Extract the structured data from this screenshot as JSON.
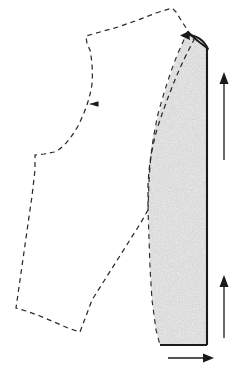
{
  "figure": {
    "width": 239,
    "height": 370,
    "background_color": "#ffffff"
  },
  "colors": {
    "outline_stroke": "#2b2b2b",
    "solid_edge_stroke": "#1a1a1a",
    "arrow_stroke": "#1a1a1a",
    "stipple_fill": "#dcdcdc",
    "stipple_dot": "#9a9a9a",
    "paper_white": "#ffffff"
  },
  "pieces": {
    "dashed_piece": {
      "name": "bodice-block-outline",
      "line_style": "dashed",
      "points": "172,8 176,12 181,20 188,31 194,40 190,47 185,57 179,70 172,86 165,104 157,128 150,150 148,168 148,190 148,210 140,224 128,243 116,262 104,281 92,300 80,332 68,328 54,322 40,316 26,311 16,308 20,280 24,252 28,224 32,196 35,170 35,155 44,154 54,152 62,148 70,139 78,127 85,112 90,98 92,84 92,70 90,56 87,44 86,36 100,32 118,27 138,20 156,13"
    },
    "shaded_piece": {
      "name": "sleeve-panel-shaded",
      "line_style": "stipple-fill",
      "fill_pattern": "random-dot-stipple",
      "points": "188,31 196,41 205,48 207,48 207,345 160,345 156,330 152,300 150,268 149,238 148,210 148,188 149,162 153,136 160,110 167,86 175,62 182,44"
    }
  },
  "edges": {
    "solid_right_edge": {
      "name": "right-grain-edge",
      "from": "207,48",
      "to": "207,345"
    },
    "solid_bottom_edge": {
      "name": "bottom-hem-edge",
      "from": "160,345",
      "to": "207,345"
    },
    "solid_top_edge": {
      "name": "shoulder-top-edge",
      "from": "190,34",
      "to": "207,48"
    }
  },
  "arrows": [
    {
      "name": "grain-arrow-upper",
      "type": "straight",
      "direction": "up",
      "from": "224,160",
      "to": "224,77"
    },
    {
      "name": "grain-arrow-lower",
      "type": "straight",
      "direction": "up",
      "from": "224,338",
      "to": "224,278"
    },
    {
      "name": "hem-arrow-bottom",
      "type": "straight",
      "direction": "right",
      "from": "168,358",
      "to": "212,358"
    },
    {
      "name": "shoulder-curved-arrow",
      "type": "curved",
      "direction": "left",
      "from": "206,47",
      "to": "185,38"
    }
  ],
  "marks": [
    {
      "name": "balance-notch",
      "position": "94,104"
    }
  ]
}
